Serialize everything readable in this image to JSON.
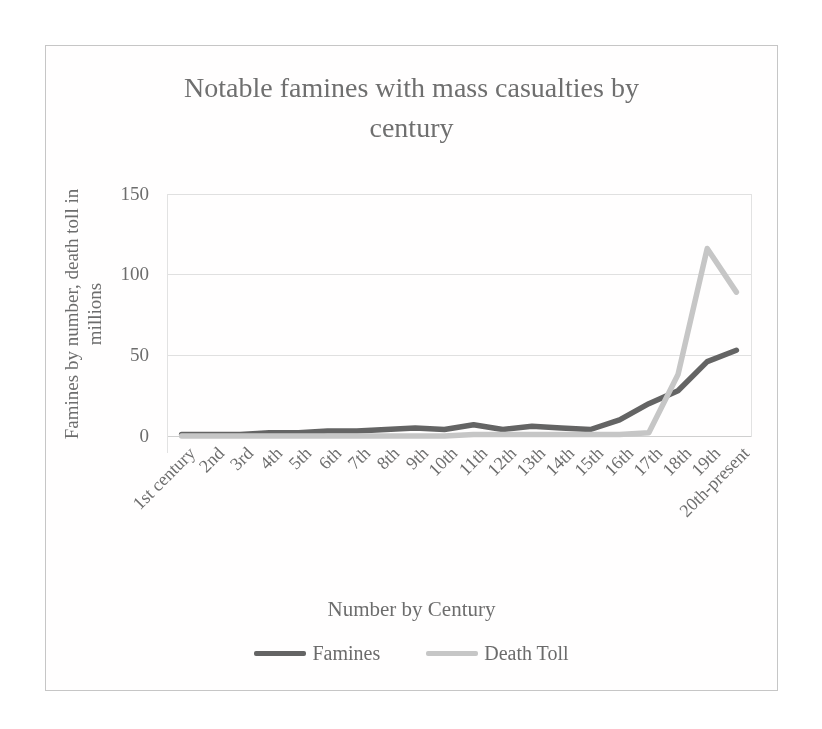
{
  "chart_data": {
    "type": "line",
    "title": "Notable famines with mass casualties by century",
    "title_lines": [
      "Notable famines with mass casualties by",
      "century"
    ],
    "xlabel": "Number by Century",
    "ylabel": "Famines by number, death toll in millions",
    "ylabel_lines": [
      "Famines by number, death toll in",
      "millions"
    ],
    "ylim": [
      0,
      150
    ],
    "yticks": [
      0,
      50,
      100,
      150
    ],
    "grid": true,
    "legend_position": "bottom",
    "categories": [
      "1st century",
      "2nd",
      "3rd",
      "4th",
      "5th",
      "6th",
      "7th",
      "8th",
      "9th",
      "10th",
      "11th",
      "12th",
      "13th",
      "14th",
      "15th",
      "16th",
      "17th",
      "18th",
      "19th",
      "20th-present"
    ],
    "series": [
      {
        "name": "Famines",
        "color": "#646464",
        "values": [
          1,
          1,
          1,
          2,
          2,
          3,
          3,
          4,
          5,
          4,
          7,
          4,
          6,
          5,
          4,
          10,
          20,
          28,
          46,
          53
        ]
      },
      {
        "name": "Death Toll",
        "color": "#c6c6c6",
        "values": [
          0,
          0,
          0,
          0,
          0,
          0,
          0,
          0,
          0,
          0,
          1,
          1,
          1,
          1,
          1,
          1,
          2,
          38,
          116,
          89
        ]
      }
    ]
  },
  "colors": {
    "card_border": "#c6c6c6",
    "gridline": "#e0e0e0",
    "text": "#6d6d6d",
    "background": "#ffffff"
  }
}
